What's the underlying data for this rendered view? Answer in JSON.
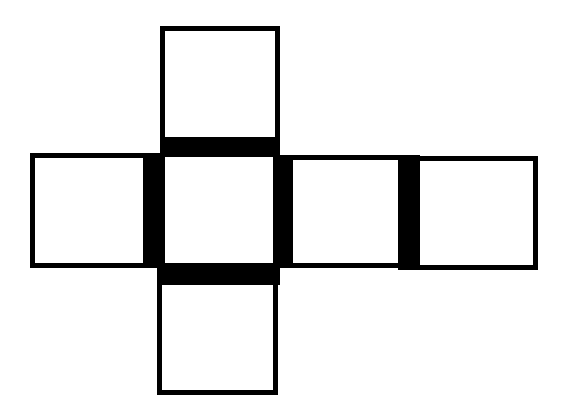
{
  "diagram": {
    "type": "cube-net",
    "colors": {
      "line": "#000000",
      "background": "#ffffff"
    },
    "faces": [
      {
        "id": "top",
        "x": 160,
        "y": 26,
        "w": 120,
        "h": 131
      },
      {
        "id": "left",
        "x": 30,
        "y": 153,
        "w": 133,
        "h": 115
      },
      {
        "id": "center",
        "x": 160,
        "y": 140,
        "w": 120,
        "h": 145
      },
      {
        "id": "right",
        "x": 273,
        "y": 155,
        "w": 147,
        "h": 113
      },
      {
        "id": "far-right",
        "x": 398,
        "y": 156,
        "w": 140,
        "h": 114
      },
      {
        "id": "bottom",
        "x": 157,
        "y": 263,
        "w": 121,
        "h": 132
      }
    ],
    "bands": [
      {
        "id": "top-center",
        "x": 162,
        "y": 137,
        "w": 116,
        "h": 20
      },
      {
        "id": "left-center",
        "x": 143,
        "y": 153,
        "w": 20,
        "h": 114
      },
      {
        "id": "center-right",
        "x": 273,
        "y": 155,
        "w": 20,
        "h": 113
      },
      {
        "id": "right-farright",
        "x": 398,
        "y": 156,
        "w": 22,
        "h": 112
      },
      {
        "id": "center-bottom",
        "x": 159,
        "y": 263,
        "w": 118,
        "h": 22
      }
    ]
  }
}
